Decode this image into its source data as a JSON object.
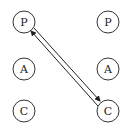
{
  "diagram": {
    "nodes": [
      {
        "id": "left-P",
        "label": "P",
        "cx": 24,
        "cy": 22
      },
      {
        "id": "left-A",
        "label": "A",
        "cx": 24,
        "cy": 69
      },
      {
        "id": "left-C",
        "label": "C",
        "cx": 24,
        "cy": 111
      },
      {
        "id": "right-P",
        "label": "P",
        "cx": 108,
        "cy": 22
      },
      {
        "id": "right-A",
        "label": "A",
        "cx": 108,
        "cy": 69
      },
      {
        "id": "right-C",
        "label": "C",
        "cx": 108,
        "cy": 111
      }
    ],
    "edges": [
      {
        "from": "left-P",
        "to": "right-C",
        "arrow": "end"
      },
      {
        "from": "right-C",
        "to": "left-P",
        "arrow": "end"
      }
    ],
    "colors": {
      "stroke": "#333333",
      "text": "#222222",
      "background": "#ffffff"
    }
  }
}
